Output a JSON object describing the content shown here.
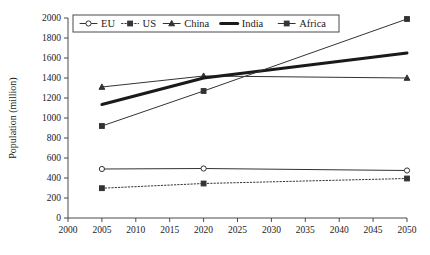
{
  "chart_data": {
    "type": "line",
    "title": "",
    "xlabel": "",
    "ylabel": "Population (million)",
    "xlim": [
      2000,
      2050
    ],
    "ylim": [
      0,
      2000
    ],
    "xticks": [
      2000,
      2005,
      2010,
      2015,
      2020,
      2025,
      2030,
      2035,
      2040,
      2045,
      2050
    ],
    "yticks": [
      0,
      200,
      400,
      600,
      800,
      1000,
      1200,
      1400,
      1600,
      1800,
      2000
    ],
    "grid": false,
    "legend_position": "top-center",
    "x": [
      2005,
      2020,
      2050
    ],
    "series": [
      {
        "name": "EU",
        "values": [
          490,
          495,
          475
        ],
        "marker": "open-circle",
        "linestyle": "solid",
        "linewidth": 1,
        "color": "#333333"
      },
      {
        "name": "US",
        "values": [
          298,
          345,
          395
        ],
        "marker": "filled-square",
        "linestyle": "dotted",
        "linewidth": 1,
        "color": "#333333"
      },
      {
        "name": "China",
        "values": [
          1310,
          1420,
          1400
        ],
        "marker": "filled-triangle",
        "linestyle": "solid",
        "linewidth": 1,
        "color": "#333333"
      },
      {
        "name": "India",
        "values": [
          1135,
          1400,
          1650
        ],
        "marker": "none",
        "linestyle": "solid",
        "linewidth": 3,
        "color": "#1a1a1a"
      },
      {
        "name": "Africa",
        "values": [
          920,
          1270,
          1990
        ],
        "marker": "filled-square",
        "linestyle": "solid",
        "linewidth": 1,
        "color": "#333333"
      }
    ]
  },
  "axis": {
    "y_title": "Population (million)",
    "x_tick_labels": [
      "2000",
      "2005",
      "2010",
      "2015",
      "2020",
      "2025",
      "2030",
      "2035",
      "2040",
      "2045",
      "2050"
    ],
    "y_tick_labels": [
      "0",
      "200",
      "400",
      "600",
      "800",
      "1000",
      "1200",
      "1400",
      "1600",
      "1800",
      "2000"
    ]
  },
  "legend": {
    "entries": [
      {
        "label": "EU"
      },
      {
        "label": "US"
      },
      {
        "label": "China"
      },
      {
        "label": "India"
      },
      {
        "label": "Africa"
      }
    ]
  }
}
